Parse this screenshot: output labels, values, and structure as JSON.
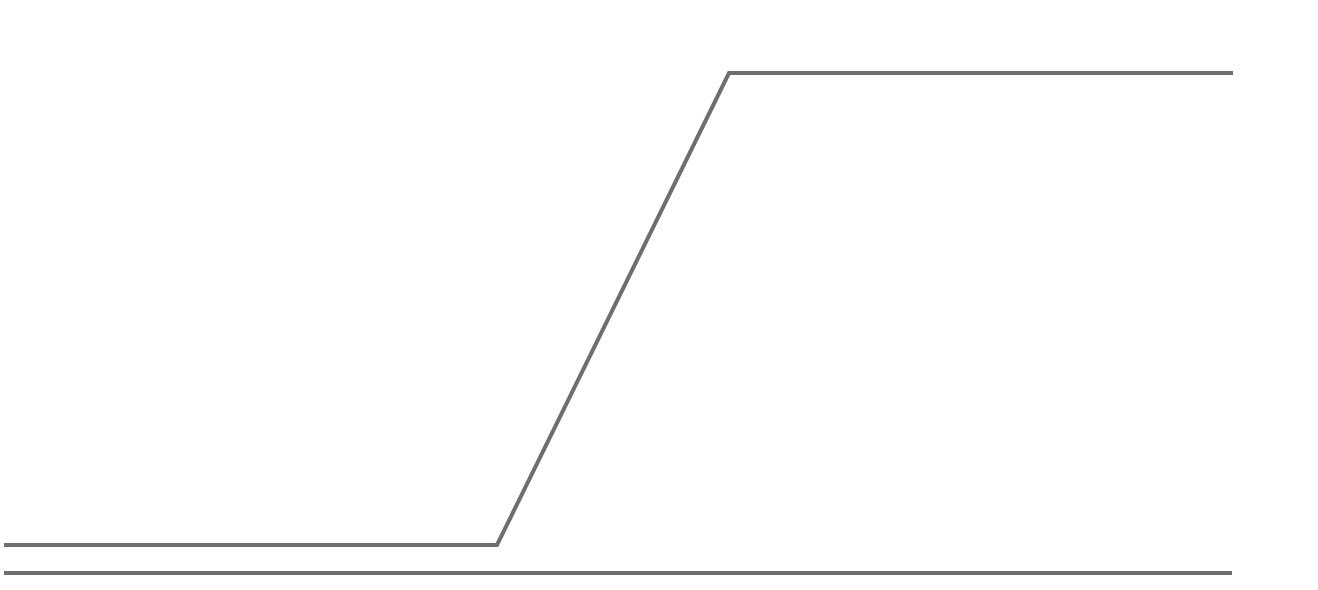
{
  "canvas": {
    "width": 1318,
    "height": 590,
    "background": "#ffffff"
  },
  "style": {
    "line_color": "#6e6e6e",
    "line_width": 4
  },
  "chart_data": {
    "type": "line",
    "title": "",
    "xlabel": "",
    "ylabel": "",
    "grid": false,
    "legend": null,
    "x_pixel_range": [
      0,
      1318
    ],
    "y_pixel_range": [
      0,
      590
    ],
    "series": [
      {
        "name": "ramp-signal",
        "points": [
          {
            "x": 4,
            "y": 545
          },
          {
            "x": 497,
            "y": 545
          },
          {
            "x": 729,
            "y": 73
          },
          {
            "x": 1233,
            "y": 73
          }
        ]
      },
      {
        "name": "baseline",
        "points": [
          {
            "x": 4,
            "y": 573
          },
          {
            "x": 1232,
            "y": 573
          }
        ]
      }
    ]
  }
}
